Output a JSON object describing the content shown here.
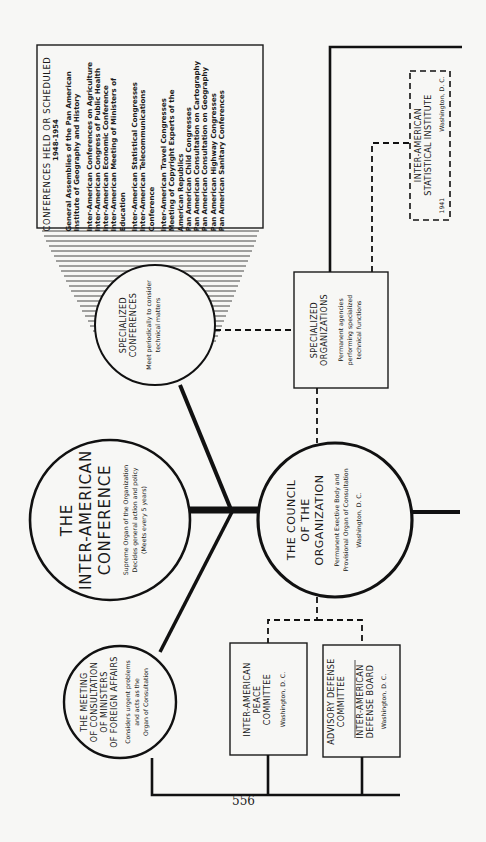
{
  "page_number": "556",
  "conferences_box": {
    "title": "CONFERENCES HELD OR SCHEDULED",
    "years": "1948-1954",
    "groups": [
      [
        "General Assemblies of the Pan American",
        "Institute of Geography and History"
      ],
      [
        "Inter-American Conferences on Agriculture",
        "Inter-American Congress of Public Health",
        "Inter-American Economic Conference",
        "Inter-American Meeting of Ministers of",
        "Education"
      ],
      [
        "Inter-American Statistical Congresses",
        "Inter-American Telecommunications",
        "Conference"
      ],
      [
        "Inter-American Travel Congresses",
        "Meeting of Copyright Experts of the",
        "American Republics",
        "Pan American Child Congresses",
        "Pan American Consultation on Cartography",
        "Pan American Consultation on Geography",
        "Pan American Highway Congresses",
        "Pan American Sanitary Conferences"
      ]
    ]
  },
  "nodes": {
    "inter_american_conference": {
      "title_lines": [
        "THE",
        "INTER-AMERICAN",
        "CONFERENCE"
      ],
      "desc_lines": [
        "Supreme Organ of the Organization",
        "Decides general action and policy",
        "(Meets every 5 years)"
      ]
    },
    "specialized_conferences": {
      "title_lines": [
        "SPECIALIZED",
        "CONFERENCES"
      ],
      "desc_lines": [
        "Meet periodically to consider",
        "technical matters"
      ]
    },
    "council": {
      "title_lines": [
        "THE COUNCIL",
        "OF THE",
        "ORGANIZATION"
      ],
      "desc_lines": [
        "Permanent Exective Body and",
        "Provisional Organ of Consultation",
        "Washington, D. C."
      ]
    },
    "meeting_of_consultation": {
      "title_lines": [
        "THE MEETING",
        "OF CONSULTATION",
        "OF MINISTERS",
        "OF FOREIGN AFFAIRS"
      ],
      "desc_lines": [
        "Considers urgent problems",
        "and acts as the",
        "Organ of Consultation"
      ]
    },
    "specialized_organizations": {
      "title_lines": [
        "SPECIALIZED",
        "ORGANIZATIONS"
      ],
      "desc_lines": [
        "Permanent agencies",
        "performing specialized",
        "technical functions"
      ]
    },
    "statistical_institute": {
      "title_lines": [
        "INTER-AMERICAN",
        "STATISTICAL INSTITUTE"
      ],
      "year": "1941",
      "location": "Washington, D. C."
    },
    "peace_committee": {
      "title_lines": [
        "INTER-AMERICAN",
        "PEACE",
        "COMMITTEE"
      ],
      "location": "Washington, D. C."
    },
    "defense": {
      "upper_lines": [
        "ADVISORY DEFENSE",
        "COMMITTEE"
      ],
      "lower_lines": [
        "INTER-AMERICAN",
        "DEFENSE BOARD"
      ],
      "location": "Washington, D. C."
    }
  },
  "colors": {
    "ink": "#1a1a1a",
    "paper": "#f7f7f5"
  }
}
